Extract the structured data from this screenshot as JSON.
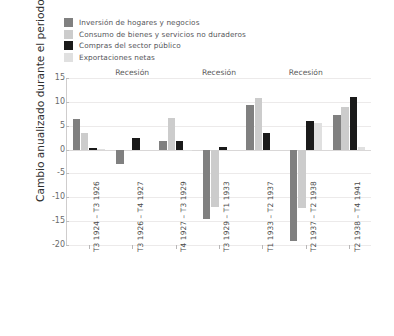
{
  "chart_data": {
    "type": "bar",
    "title": "",
    "xlabel": "",
    "ylabel": "Cambio anualizado durante el periodo",
    "ylim": [
      -20,
      15
    ],
    "yticks": [
      15,
      10,
      5,
      0,
      -5,
      -10,
      -15,
      -20
    ],
    "grid": true,
    "legend_position": "top-left",
    "categories": [
      "T3 1924 – T3 1926",
      "T3 1926 – T4 1927",
      "T4 1927 – T3 1929",
      "T3 1929 – T1 1933",
      "T1 1933 – T2 1937",
      "T2 1937 – T2 1938",
      "T2 1938 – T4 1941"
    ],
    "series": [
      {
        "name": "Inversión de hogares y negocios",
        "color": "#808080",
        "values": [
          6.5,
          -3.0,
          1.7,
          -14.6,
          9.3,
          -19.2,
          7.2
        ]
      },
      {
        "name": "Consumo de bienes y servicios no duraderos",
        "color": "#cccccc",
        "values": [
          3.4,
          0.0,
          6.6,
          -12.1,
          10.9,
          -12.3,
          8.9
        ]
      },
      {
        "name": "Compras del sector público",
        "color": "#1a1a1a",
        "values": [
          0.4,
          2.4,
          1.8,
          0.5,
          3.4,
          5.9,
          11.1
        ]
      },
      {
        "name": "Exportaciones netas",
        "color": "#e0e0e0",
        "values": [
          0.2,
          0.0,
          -0.3,
          0.0,
          0.0,
          5.6,
          0.5
        ]
      }
    ],
    "annotations": [
      {
        "text": "Recesión",
        "category_index": 1
      },
      {
        "text": "Recesión",
        "category_index": 3
      },
      {
        "text": "Recesión",
        "category_index": 5
      }
    ]
  }
}
